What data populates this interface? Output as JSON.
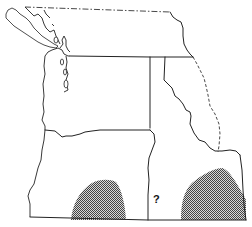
{
  "map": {
    "type": "range map",
    "region": "Pacific Northwest",
    "annotations": [
      {
        "id": "unknown-marker",
        "text": "?",
        "x": 153,
        "y": 193
      }
    ],
    "shaded_areas": [
      {
        "id": "range-area-west",
        "description": "stippled distribution area, south-central"
      },
      {
        "id": "range-area-east",
        "description": "stippled distribution area, southeast"
      }
    ],
    "colors": {
      "line": "#222222",
      "shading": "#7a7a7a",
      "background": "#ffffff"
    },
    "legend": []
  }
}
